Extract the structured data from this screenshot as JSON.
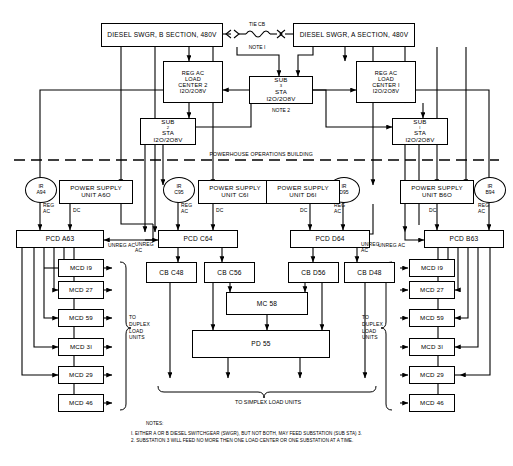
{
  "diagram": {
    "building_label": "POWERHOUSE OPERATIONS BUILDING",
    "tie": {
      "top_label": "TIE CB",
      "bottom_label": "NOTE I"
    },
    "note2_label": "NOTE 2",
    "simplex_label": "TO SIMPLEX LOAD UNITS",
    "duplex_label_left": "TO\nDUPLEX\nLOAD\nUNITS",
    "duplex_label_right": "TO\nDUPLEX\nLOAD\nUNITS",
    "switchgear": [
      {
        "id": "swgr-b",
        "label": "DIESEL SWGR, B SECTION, 480V"
      },
      {
        "id": "swgr-a",
        "label": "DIESEL SWGR, A SECTION, 480V"
      }
    ],
    "load_centers": [
      {
        "id": "load-center-2",
        "lines": [
          "REG AC",
          "LOAD",
          "CENTER 2",
          "I2O/2O8V"
        ]
      },
      {
        "id": "load-center-1",
        "lines": [
          "REG AC",
          "LOAD",
          "CENTER I",
          "I2O/2O8V"
        ]
      }
    ],
    "substations": [
      {
        "id": "sub3-sta",
        "name": "SUB",
        "index": "3",
        "suffix": " STA",
        "voltage": "I2O/2O8V"
      },
      {
        "id": "sub2-sta",
        "name": "SUB",
        "index": "2",
        "suffix": " STA",
        "voltage": "I2O/2O8V"
      },
      {
        "id": "sub1-sta",
        "name": "SUB",
        "index": "I",
        "suffix": " STA",
        "voltage": "I2O/2O8V"
      }
    ],
    "power_supply_units": [
      {
        "id": "psu-a60",
        "lines": [
          "POWER SUPPLY",
          "UNIT A6O"
        ]
      },
      {
        "id": "psu-c61",
        "lines": [
          "POWER SUPPLY",
          "UNIT C6I"
        ]
      },
      {
        "id": "psu-d61",
        "lines": [
          "POWER SUPPLY",
          "UNIT D6I"
        ]
      },
      {
        "id": "psu-b60",
        "lines": [
          "POWER SUPPLY",
          "UNIT B6O"
        ]
      }
    ],
    "inverters": [
      {
        "id": "ir-a94",
        "tag": "IR",
        "num": "A94"
      },
      {
        "id": "ir-c95",
        "tag": "IR",
        "num": "C95"
      },
      {
        "id": "ir-d95",
        "tag": "IR",
        "num": "D95"
      },
      {
        "id": "ir-b94",
        "tag": "IR",
        "num": "B94"
      }
    ],
    "pcds": [
      {
        "id": "pcd-a63",
        "label": "PCD A63"
      },
      {
        "id": "pcd-c64",
        "label": "PCD C64"
      },
      {
        "id": "pcd-d64",
        "label": "PCD D64"
      },
      {
        "id": "pcd-b63",
        "label": "PCD B63"
      }
    ],
    "circuit_breakers": [
      {
        "id": "cb-c48",
        "label": "CB C48"
      },
      {
        "id": "cb-c56",
        "label": "CB C56"
      },
      {
        "id": "cb-d56",
        "label": "CB D56"
      },
      {
        "id": "cb-d48",
        "label": "CB D48"
      }
    ],
    "mc": {
      "id": "mc-58",
      "label": "MC 58"
    },
    "pd": {
      "id": "pd-55",
      "label": "PD 55"
    },
    "mcd_left": [
      {
        "id": "mcd-l-19",
        "label": "MCD I9"
      },
      {
        "id": "mcd-l-27",
        "label": "MCD 27"
      },
      {
        "id": "mcd-l-59",
        "label": "MCD 59"
      },
      {
        "id": "mcd-l-31",
        "label": "MCD 3I"
      },
      {
        "id": "mcd-l-29",
        "label": "MCD 29"
      },
      {
        "id": "mcd-l-46",
        "label": "MCD 46"
      }
    ],
    "mcd_right": [
      {
        "id": "mcd-r-19",
        "label": "MCD I9"
      },
      {
        "id": "mcd-r-27",
        "label": "MCD 27"
      },
      {
        "id": "mcd-r-59",
        "label": "MCD 59"
      },
      {
        "id": "mcd-r-31",
        "label": "MCD 3I"
      },
      {
        "id": "mcd-r-29",
        "label": "MCD 29"
      },
      {
        "id": "mcd-r-46",
        "label": "MCD 46"
      }
    ],
    "signal_labels": {
      "reg_ac_a": "REG\nAC",
      "reg_ac_c": "REG\nAC",
      "reg_ac_d": "REG\nAC",
      "reg_ac_b": "REG\nAC",
      "dc_a": "DC",
      "dc_c": "DC",
      "dc_d": "DC",
      "dc_b": "DC",
      "unreg_ac_a": "UNREG AC",
      "unreg_ac_c": "UNREG\nAC",
      "unreg_ac_d": "UNREG\nAC",
      "unreg_ac_b": "UNREG AC"
    },
    "notes": {
      "heading": "NOTES:",
      "items": [
        "I. EITHER A OR B DIESEL SWITCHGEAR (SWGR), BUT NOT BOTH, MAY FEED SUBSTATION (SUB STA) 3.",
        "2. SUBSTATION 3 WILL FEED NO MORE THEN ONE LOAD CENTER OR ONE SUBSTATION AT A TIME."
      ]
    },
    "colors": {
      "line": "#000000",
      "background": "#ffffff"
    }
  }
}
